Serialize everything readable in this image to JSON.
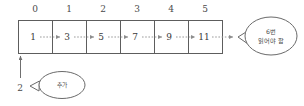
{
  "diagram": {
    "indices": [
      "0",
      "1",
      "2",
      "3",
      "4",
      "5"
    ],
    "cells": [
      "1",
      "3",
      "5",
      "7",
      "9",
      "11"
    ],
    "insert_value": "2",
    "bubbles": [
      {
        "id": "shift-note",
        "lines": [
          "6번",
          "읽어야 함"
        ],
        "position": "right"
      },
      {
        "id": "add-note",
        "lines": [
          "추가"
        ],
        "position": "bottom-left"
      }
    ],
    "colors": {
      "box_stroke": "#5d5d5d",
      "flow_arrow": "#9b9b9b",
      "bubble_stroke": "#6a6a6a",
      "text": "#3a3a3a",
      "background": "#ffffff"
    }
  }
}
